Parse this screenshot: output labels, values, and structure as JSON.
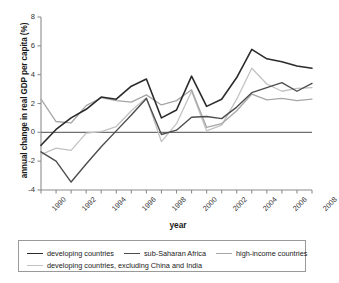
{
  "chart_data": {
    "type": "line",
    "title": "",
    "xlabel": "year",
    "ylabel": "annual change in real GDP per capita (%)",
    "xlim": [
      1990,
      2008
    ],
    "ylim": [
      -4,
      8
    ],
    "ytick_labels": [
      "8",
      "6",
      "4",
      "2",
      "0",
      "-2",
      "-4"
    ],
    "ytick_values": [
      8,
      6,
      4,
      2,
      0,
      -2,
      -4
    ],
    "xtick_labels": [
      "1990",
      "1992",
      "1994",
      "1996",
      "1998",
      "2000",
      "2002",
      "2004",
      "2006",
      "2008"
    ],
    "xtick_values": [
      1990,
      1992,
      1994,
      1996,
      1998,
      2000,
      2002,
      2004,
      2006,
      2008
    ],
    "x": [
      1990,
      1991,
      1992,
      1993,
      1994,
      1995,
      1996,
      1997,
      1998,
      1999,
      2000,
      2001,
      2002,
      2003,
      2004,
      2005,
      2006,
      2007,
      2008
    ],
    "grid": false,
    "zero_line": true,
    "legend_position": "bottom",
    "series": [
      {
        "name": "developing countries",
        "color": "#2b2b2b",
        "width": 1.6,
        "values": [
          -0.9,
          0.2,
          1.0,
          1.6,
          2.45,
          2.3,
          3.2,
          3.7,
          1.0,
          1.55,
          3.9,
          1.8,
          2.3,
          3.8,
          5.75,
          5.1,
          4.9,
          4.6,
          4.45
        ]
      },
      {
        "name": "sub-Saharan Africa",
        "color": "#4d4d4d",
        "width": 1.4,
        "values": [
          -1.35,
          -2.0,
          -3.45,
          -2.2,
          -1.0,
          0.1,
          1.2,
          2.35,
          -0.15,
          0.15,
          1.05,
          1.1,
          0.95,
          1.75,
          2.75,
          3.1,
          3.45,
          2.85,
          3.4
        ]
      },
      {
        "name": "high-income countries",
        "color": "#a6a6a6",
        "width": 1.3,
        "values": [
          2.3,
          0.75,
          0.65,
          1.85,
          2.4,
          2.2,
          2.1,
          2.6,
          1.9,
          2.2,
          2.95,
          0.35,
          0.6,
          1.5,
          2.65,
          2.25,
          2.35,
          2.2,
          2.3
        ]
      },
      {
        "name": "developing countries, excluding China and India",
        "color": "#c2c2c2",
        "width": 1.3,
        "values": [
          -1.55,
          -1.1,
          -1.25,
          -0.05,
          0.05,
          0.4,
          1.5,
          2.4,
          -0.65,
          0.6,
          2.85,
          0.1,
          0.5,
          2.3,
          4.45,
          3.35,
          2.85,
          3.05,
          3.1
        ]
      }
    ]
  },
  "legend": {
    "items": [
      {
        "label": "developing countries",
        "color": "#2b2b2b",
        "width": 1.8
      },
      {
        "label": "sub-Saharan Africa",
        "color": "#4d4d4d",
        "width": 1.6
      },
      {
        "label": "high-income countries",
        "color": "#a6a6a6",
        "width": 1.4
      },
      {
        "label": "developing countries, excluding China and India",
        "color": "#c2c2c2",
        "width": 1.4
      }
    ]
  },
  "axes": {
    "zero_line_color": "#6f6f6f",
    "axis_color": "#8c8c8c"
  }
}
